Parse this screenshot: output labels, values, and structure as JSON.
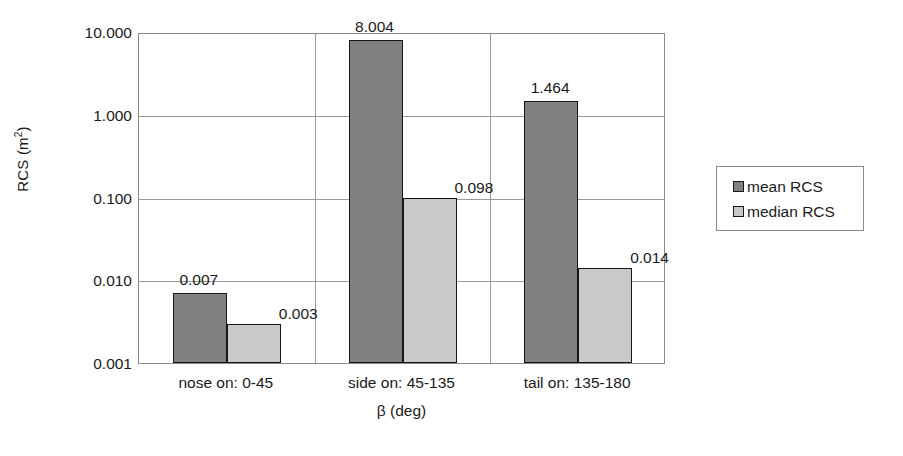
{
  "chart_data": {
    "type": "bar",
    "title": "",
    "xlabel": "β (deg)",
    "ylabel": "RCS (m²)",
    "ylabel_base": "RCS (m",
    "ylabel_sup": "2",
    "ylabel_close": ")",
    "yscale": "log",
    "ylim": [
      0.001,
      10.0
    ],
    "yticks": [
      10.0,
      1.0,
      0.1,
      0.01,
      0.001
    ],
    "ytick_labels": [
      "10.000",
      "1.000",
      "0.100",
      "0.010",
      "0.001"
    ],
    "grid": true,
    "legend_position": "right",
    "categories": [
      "nose on:  0-45",
      "side on: 45-135",
      "tail on: 135-180"
    ],
    "series": [
      {
        "name": "mean RCS",
        "color": "#808080",
        "values": [
          0.007,
          8.004,
          1.464
        ],
        "value_labels": [
          "0.007",
          "8.004",
          "1.464"
        ]
      },
      {
        "name": "median RCS",
        "color": "#c9c9c9",
        "values": [
          0.003,
          0.098,
          0.014
        ],
        "value_labels": [
          "0.003",
          "0.098",
          "0.014"
        ]
      }
    ]
  },
  "legend": {
    "items": [
      {
        "label": "mean RCS",
        "swatch": "mean"
      },
      {
        "label": "median RCS",
        "swatch": "median"
      }
    ]
  }
}
